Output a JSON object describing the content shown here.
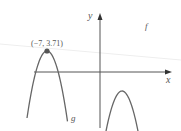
{
  "chart_data": {
    "type": "line",
    "title": "",
    "xlabel": "x",
    "ylabel": "y",
    "axis_arrows": true,
    "grid": false,
    "series": [
      {
        "name": "f",
        "label": "f",
        "shape": "upward parabola, vertex below x-axis to the right of the y-axis",
        "x_intercepts_approx": [
          1,
          3
        ],
        "color": "#666666"
      },
      {
        "name": "g",
        "label": "g",
        "shape": "downward parabola with maximum at the annotated point",
        "vertex": [
          -7,
          3.71
        ],
        "color": "#666666"
      }
    ],
    "annotations": [
      {
        "text": "(−7, 3.71)",
        "point": [
          -7,
          3.71
        ],
        "marker": "dot"
      }
    ],
    "colors": {
      "axes": "#555555",
      "curves": "#666666",
      "marker": "#555555",
      "text": "#555555"
    }
  }
}
